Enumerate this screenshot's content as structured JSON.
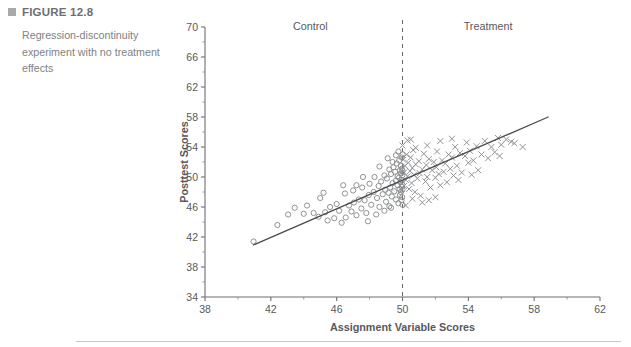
{
  "caption": {
    "bullet_icon": "square-bullet-icon",
    "figure_label": "FIGURE 12.8",
    "figure_text": "Regression-discontinuity experiment with no treatment effects"
  },
  "colors": {
    "heading": "#6d6e71",
    "caption_text": "#808285",
    "axis": "#6d6e71",
    "marker": "#8a8c8e",
    "fit_line": "#4c4d4f",
    "rule": "#c6c7c9",
    "background": "#ffffff"
  },
  "chart_data": {
    "type": "scatter",
    "title": "",
    "xlabel": "Assignment Variable Scores",
    "ylabel": "Posttest Scores",
    "xlim": [
      38,
      62
    ],
    "ylim": [
      34,
      70
    ],
    "xticks": [
      38,
      42,
      46,
      50,
      54,
      58,
      62
    ],
    "yticks": [
      34,
      38,
      42,
      46,
      50,
      54,
      58,
      62,
      66,
      70
    ],
    "xtick_labels": [
      "38",
      "42",
      "46",
      "50",
      "54",
      "58",
      "62"
    ],
    "ytick_labels": [
      "34",
      "38",
      "42",
      "46",
      "50",
      "54",
      "58",
      "62",
      "66",
      "70"
    ],
    "minor_tick_step": 2,
    "grid": false,
    "legend": null,
    "annotations": [
      {
        "name": "control-region-label",
        "text": "Control",
        "x": 44.4,
        "y": 69.6
      },
      {
        "name": "treatment-region-label",
        "text": "Treatment",
        "x": 55.2,
        "y": 69.6
      }
    ],
    "cutoff": {
      "name": "assignment-cutoff",
      "x": 50,
      "style": "dashed"
    },
    "fit_line": {
      "name": "regression-fit-line",
      "x0": 40.95,
      "y0": 40.95,
      "x1": 58.85,
      "y1": 58.0
    },
    "series": [
      {
        "name": "Control",
        "marker": "circle",
        "points": [
          [
            40.95,
            41.4
          ],
          [
            42.4,
            43.6
          ],
          [
            43.05,
            45.0
          ],
          [
            43.45,
            45.9
          ],
          [
            44.0,
            45.1
          ],
          [
            44.6,
            45.2
          ],
          [
            44.9,
            44.7
          ],
          [
            45.0,
            47.2
          ],
          [
            45.3,
            45.3
          ],
          [
            45.45,
            44.2
          ],
          [
            45.6,
            46.0
          ],
          [
            45.85,
            44.5
          ],
          [
            46.0,
            46.4
          ],
          [
            46.15,
            45.5
          ],
          [
            46.3,
            43.9
          ],
          [
            46.5,
            47.8
          ],
          [
            46.55,
            44.6
          ],
          [
            46.75,
            46.2
          ],
          [
            46.9,
            45.4
          ],
          [
            47.0,
            48.2
          ],
          [
            47.05,
            46.6
          ],
          [
            47.2,
            44.9
          ],
          [
            47.35,
            47.0
          ],
          [
            47.5,
            45.8
          ],
          [
            47.55,
            48.6
          ],
          [
            47.7,
            46.9
          ],
          [
            47.8,
            45.2
          ],
          [
            47.95,
            47.6
          ],
          [
            48.0,
            49.1
          ],
          [
            48.1,
            46.3
          ],
          [
            48.25,
            48.0
          ],
          [
            48.3,
            50.0
          ],
          [
            48.45,
            47.2
          ],
          [
            48.55,
            48.8
          ],
          [
            48.6,
            46.0
          ],
          [
            48.7,
            49.4
          ],
          [
            48.8,
            47.7
          ],
          [
            48.9,
            50.2
          ],
          [
            48.95,
            48.3
          ],
          [
            49.0,
            46.7
          ],
          [
            49.05,
            49.8
          ],
          [
            49.15,
            47.9
          ],
          [
            49.2,
            51.0
          ],
          [
            49.25,
            48.6
          ],
          [
            49.3,
            50.4
          ],
          [
            49.35,
            47.4
          ],
          [
            49.4,
            49.2
          ],
          [
            49.45,
            51.3
          ],
          [
            49.5,
            48.1
          ],
          [
            49.55,
            50.7
          ],
          [
            49.6,
            49.5
          ],
          [
            49.6,
            47.0
          ],
          [
            49.65,
            51.8
          ],
          [
            49.7,
            48.9
          ],
          [
            49.7,
            50.1
          ],
          [
            49.75,
            46.5
          ],
          [
            49.78,
            49.9
          ],
          [
            49.8,
            52.2
          ],
          [
            49.82,
            48.4
          ],
          [
            49.85,
            50.9
          ],
          [
            49.85,
            47.6
          ],
          [
            49.88,
            49.3
          ],
          [
            49.9,
            51.5
          ],
          [
            49.9,
            48.0
          ],
          [
            49.92,
            50.5
          ],
          [
            49.94,
            46.9
          ],
          [
            49.95,
            49.6
          ],
          [
            49.95,
            52.6
          ],
          [
            49.96,
            48.7
          ],
          [
            49.97,
            51.1
          ],
          [
            49.98,
            50.2
          ],
          [
            49.98,
            47.3
          ],
          [
            49.99,
            49.0
          ],
          [
            50.0,
            53.0
          ],
          [
            50.0,
            50.8
          ],
          [
            50.0,
            48.3
          ],
          [
            49.6,
            52.9
          ],
          [
            49.4,
            52.0
          ],
          [
            49.2,
            46.1
          ],
          [
            48.9,
            45.5
          ],
          [
            48.4,
            45.0
          ],
          [
            47.9,
            44.1
          ],
          [
            47.2,
            48.9
          ],
          [
            46.4,
            48.9
          ],
          [
            45.2,
            47.9
          ],
          [
            44.2,
            46.2
          ],
          [
            49.1,
            52.5
          ],
          [
            49.75,
            53.4
          ],
          [
            48.6,
            51.4
          ],
          [
            47.6,
            50.0
          ],
          [
            49.3,
            45.9
          ],
          [
            50.0,
            46.3
          ]
        ]
      },
      {
        "name": "Treatment",
        "marker": "cross",
        "points": [
          [
            50.0,
            54.2
          ],
          [
            50.05,
            52.3
          ],
          [
            50.1,
            50.6
          ],
          [
            50.1,
            48.8
          ],
          [
            50.15,
            51.5
          ],
          [
            50.2,
            49.6
          ],
          [
            50.25,
            53.0
          ],
          [
            50.3,
            50.1
          ],
          [
            50.35,
            51.9
          ],
          [
            50.4,
            48.4
          ],
          [
            50.45,
            50.8
          ],
          [
            50.5,
            52.6
          ],
          [
            50.55,
            49.2
          ],
          [
            50.6,
            51.2
          ],
          [
            50.65,
            53.6
          ],
          [
            50.7,
            50.3
          ],
          [
            50.75,
            48.0
          ],
          [
            50.8,
            51.7
          ],
          [
            50.9,
            49.8
          ],
          [
            51.0,
            52.1
          ],
          [
            51.05,
            50.5
          ],
          [
            51.1,
            47.5
          ],
          [
            51.2,
            51.0
          ],
          [
            51.3,
            53.1
          ],
          [
            51.4,
            49.4
          ],
          [
            51.45,
            51.6
          ],
          [
            51.5,
            50.0
          ],
          [
            51.6,
            52.4
          ],
          [
            51.7,
            48.6
          ],
          [
            51.8,
            50.9
          ],
          [
            51.9,
            52.0
          ],
          [
            52.0,
            49.9
          ],
          [
            52.05,
            51.3
          ],
          [
            52.1,
            53.4
          ],
          [
            52.2,
            50.4
          ],
          [
            52.3,
            48.9
          ],
          [
            52.4,
            52.2
          ],
          [
            52.5,
            50.7
          ],
          [
            52.6,
            51.8
          ],
          [
            52.7,
            49.3
          ],
          [
            52.8,
            53.0
          ],
          [
            52.9,
            51.1
          ],
          [
            53.0,
            52.6
          ],
          [
            53.1,
            50.2
          ],
          [
            53.2,
            54.0
          ],
          [
            53.3,
            51.5
          ],
          [
            53.5,
            53.2
          ],
          [
            53.6,
            50.6
          ],
          [
            53.8,
            52.8
          ],
          [
            53.9,
            54.6
          ],
          [
            54.0,
            51.9
          ],
          [
            54.1,
            53.5
          ],
          [
            54.3,
            52.2
          ],
          [
            54.5,
            54.1
          ],
          [
            54.6,
            50.9
          ],
          [
            54.8,
            53.0
          ],
          [
            55.0,
            54.8
          ],
          [
            55.2,
            52.5
          ],
          [
            55.4,
            54.0
          ],
          [
            55.6,
            53.3
          ],
          [
            55.8,
            55.2
          ],
          [
            56.0,
            54.3
          ],
          [
            56.3,
            55.0
          ],
          [
            56.6,
            54.7
          ],
          [
            57.3,
            54.0
          ],
          [
            53.0,
            55.1
          ],
          [
            52.3,
            54.8
          ],
          [
            51.5,
            54.2
          ],
          [
            50.8,
            53.9
          ],
          [
            50.3,
            54.9
          ],
          [
            51.2,
            46.6
          ],
          [
            51.6,
            46.9
          ],
          [
            52.0,
            47.3
          ],
          [
            50.6,
            47.1
          ],
          [
            53.4,
            49.6
          ],
          [
            54.2,
            50.3
          ],
          [
            50.2,
            46.2
          ],
          [
            50.5,
            55.0
          ],
          [
            55.9,
            52.8
          ],
          [
            56.8,
            54.5
          ]
        ]
      }
    ]
  }
}
